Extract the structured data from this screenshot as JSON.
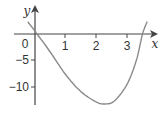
{
  "chart_data": {
    "type": "line",
    "title": "",
    "xlabel": "x",
    "ylabel": "y",
    "x_ticks": [
      "0",
      "1",
      "2",
      "3"
    ],
    "y_ticks": [
      "-5",
      "-10"
    ],
    "xlim": [
      -0.3,
      3.9
    ],
    "ylim": [
      -15,
      4
    ],
    "grid": false,
    "legend": null,
    "series": [
      {
        "name": "curve",
        "x": [
          -0.2,
          0,
          0.1,
          0.5,
          1,
          1.5,
          2,
          2.3,
          2.6,
          3,
          3.3,
          3.5,
          3.65
        ],
        "y": [
          2.3,
          0.8,
          0,
          -3.2,
          -7.5,
          -10.8,
          -12.8,
          -13.2,
          -12.6,
          -9.5,
          -5,
          0,
          2.3
        ]
      }
    ],
    "color": "#888888"
  }
}
